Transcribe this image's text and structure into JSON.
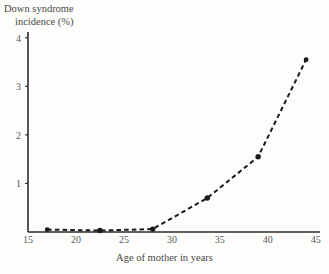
{
  "figure": {
    "background_color": "#fdfdfb",
    "ink_color": "#3b3b3b"
  },
  "chart_data": {
    "type": "line",
    "title": "",
    "subtitle": "",
    "xlabel": "Age of mother in years",
    "ylabel": "Down syndrome incidence (%)",
    "ylabel_line1": "Down syndrome",
    "ylabel_line2": "incidence (%)",
    "xlim": [
      15,
      45.5
    ],
    "ylim": [
      0,
      4.15
    ],
    "xticks": [
      15,
      20,
      25,
      30,
      35,
      40,
      45
    ],
    "xticklabels": [
      "15",
      "20",
      "25",
      "30",
      "35",
      "40",
      "45"
    ],
    "yticks": [
      1,
      2,
      3,
      4
    ],
    "yticklabels": [
      "1",
      "2",
      "3",
      "4"
    ],
    "grid": false,
    "legend": null,
    "line_style": "dashed",
    "marker": "filled-circle",
    "marker_color": "#1a1a1a",
    "line_color": "#1a1a1a",
    "x": [
      17.0,
      22.5,
      28.0,
      33.7,
      39.0,
      44.0
    ],
    "y": [
      0.05,
      0.03,
      0.06,
      0.7,
      1.55,
      3.55
    ],
    "series": [
      {
        "name": "Down syndrome incidence",
        "points": [
          {
            "x": 17.0,
            "y": 0.05
          },
          {
            "x": 22.5,
            "y": 0.03
          },
          {
            "x": 28.0,
            "y": 0.06
          },
          {
            "x": 33.7,
            "y": 0.7
          },
          {
            "x": 39.0,
            "y": 1.55
          },
          {
            "x": 44.0,
            "y": 3.55
          }
        ]
      }
    ],
    "annotations": []
  }
}
